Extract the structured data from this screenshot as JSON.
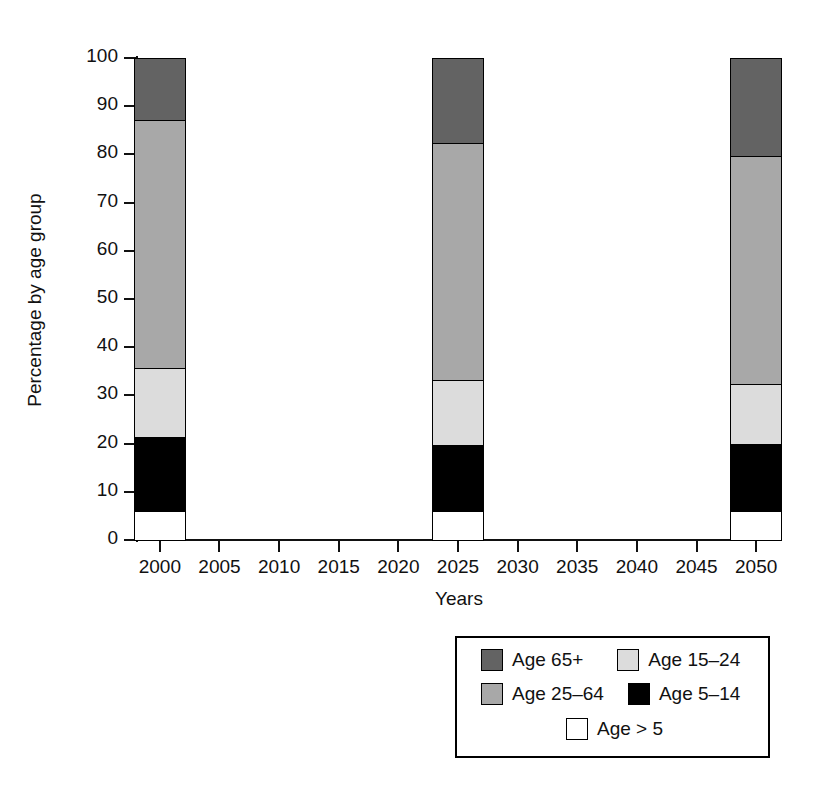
{
  "chart_data": {
    "type": "bar",
    "subtype": "stacked-bar",
    "title": "",
    "xlabel": "Years",
    "ylabel": "Percentage by age group",
    "categories": [
      "2000",
      "2025",
      "2050"
    ],
    "bar_positions": [
      2000,
      2025,
      2050
    ],
    "xlim": [
      1998,
      2052
    ],
    "ylim": [
      0,
      100
    ],
    "xticks": [
      "2000",
      "2005",
      "2010",
      "2015",
      "2020",
      "2025",
      "2030",
      "2035",
      "2040",
      "2045",
      "2050"
    ],
    "yticks": [
      "0",
      "10",
      "20",
      "30",
      "40",
      "50",
      "60",
      "70",
      "80",
      "90",
      "100"
    ],
    "grid": false,
    "legend_position": "bottom-right",
    "stack_order_bottom_to_top": [
      "Age > 5",
      "Age 5–14",
      "Age 15–24",
      "Age 25–64",
      "Age 65+"
    ],
    "series": [
      {
        "name": "Age > 5",
        "color": "#ffffff",
        "values": [
          6.2,
          6.2,
          6.2
        ]
      },
      {
        "name": "Age 5–14",
        "color": "#000000",
        "values": [
          15.2,
          13.7,
          13.9
        ]
      },
      {
        "name": "Age 15–24",
        "color": "#dcdcdc",
        "values": [
          14.3,
          13.5,
          12.3
        ]
      },
      {
        "name": "Age 25–64",
        "color": "#a8a8a8",
        "values": [
          51.6,
          49.0,
          47.3
        ]
      },
      {
        "name": "Age 65+",
        "color": "#636363",
        "values": [
          12.7,
          17.6,
          20.3
        ]
      }
    ],
    "cumulative_tops": {
      "2000": [
        6.2,
        21.4,
        35.7,
        87.3,
        100.0
      ],
      "2025": [
        6.2,
        19.9,
        33.4,
        82.4,
        100.0
      ],
      "2050": [
        6.2,
        20.1,
        32.4,
        79.7,
        100.0
      ]
    }
  },
  "legend": {
    "entries": [
      {
        "label": "Age 65+",
        "color": "#636363"
      },
      {
        "label": "Age 15–24",
        "color": "#dcdcdc"
      },
      {
        "label": "Age 25–64",
        "color": "#a8a8a8"
      },
      {
        "label": "Age 5–14",
        "color": "#000000"
      },
      {
        "label": "Age > 5",
        "color": "#ffffff"
      }
    ]
  },
  "colors": {
    "axis": "#111111",
    "outline": "#000000",
    "background": "#ffffff"
  }
}
